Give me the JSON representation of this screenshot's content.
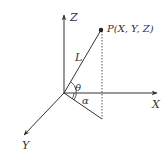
{
  "diagram": {
    "type": "3d-coordinate-system",
    "axes": {
      "x_label": "X",
      "y_label": "Y",
      "z_label": "Z"
    },
    "point": {
      "label": "P(X, Y, Z)"
    },
    "vector_label": "L",
    "angles": {
      "elevation": "θ",
      "azimuth": "α"
    },
    "colors": {
      "line": "#333333",
      "background": "#ffffff"
    }
  }
}
